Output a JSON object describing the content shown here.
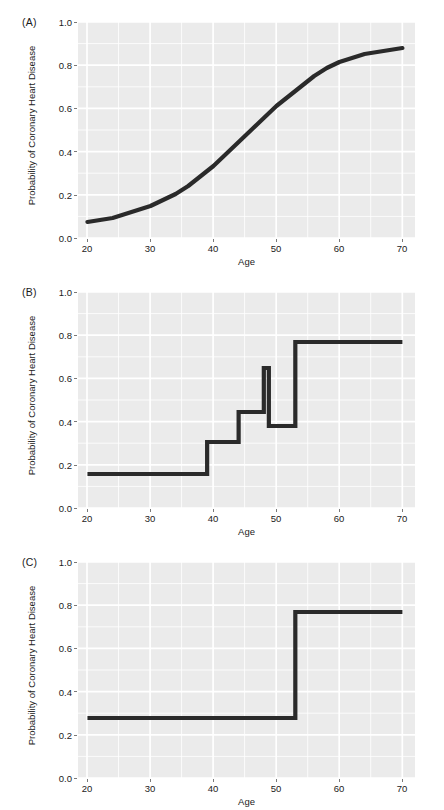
{
  "figure": {
    "width": 444,
    "height": 810,
    "panel_background": "#ebebeb",
    "gridline_color": "#ffffff",
    "line_color": "#2a2a2a",
    "axis_text_color": "#1a1a1a"
  },
  "axes": {
    "xlabel": "Age",
    "ylabel": "Probability of Coronary Heart Disease",
    "xlim": [
      18.5,
      72
    ],
    "ylim": [
      -0.03,
      1.05
    ],
    "xticks": [
      20,
      30,
      40,
      50,
      60,
      70
    ],
    "xtick_labels": [
      "20",
      "30",
      "40",
      "50",
      "60",
      "70"
    ],
    "yticks": [
      0.0,
      0.2,
      0.4,
      0.6,
      0.8,
      1.0
    ],
    "ytick_labels": [
      "0.0",
      "0.2",
      "0.4",
      "0.6",
      "0.8",
      "1.0"
    ],
    "x_minor_ticks": [
      25,
      35,
      45,
      55,
      65
    ],
    "y_minor_ticks": [
      0.1,
      0.3,
      0.5,
      0.7,
      0.9
    ],
    "grid": true
  },
  "panels": [
    {
      "id": "A",
      "tag": "(A)"
    },
    {
      "id": "B",
      "tag": "(B)"
    },
    {
      "id": "C",
      "tag": "(C)"
    }
  ],
  "chart_data": [
    {
      "type": "line",
      "panel": "(A)",
      "title": "",
      "xlabel": "Age",
      "ylabel": "Probability of Coronary Heart Disease",
      "xlim": [
        18.5,
        72
      ],
      "ylim": [
        -0.03,
        1.05
      ],
      "grid": true,
      "legend": "none",
      "series": [
        {
          "name": "logistic fit",
          "shape": "sigmoid",
          "x": [
            20,
            22,
            24,
            26,
            28,
            30,
            32,
            34,
            36,
            38,
            40,
            42,
            44,
            46,
            48,
            50,
            52,
            54,
            56,
            58,
            60,
            62,
            64,
            66,
            68,
            70
          ],
          "y": [
            0.05,
            0.06,
            0.07,
            0.09,
            0.11,
            0.13,
            0.16,
            0.19,
            0.23,
            0.28,
            0.33,
            0.39,
            0.45,
            0.51,
            0.57,
            0.63,
            0.68,
            0.73,
            0.78,
            0.82,
            0.85,
            0.87,
            0.89,
            0.9,
            0.91,
            0.92
          ]
        }
      ]
    },
    {
      "type": "line",
      "panel": "(B)",
      "title": "",
      "xlabel": "Age",
      "ylabel": "Probability of Coronary Heart Disease",
      "xlim": [
        18.5,
        72
      ],
      "ylim": [
        -0.03,
        1.05
      ],
      "grid": true,
      "legend": "none",
      "series": [
        {
          "name": "step function (many splits)",
          "shape": "step",
          "breakpoints": [
            39,
            44,
            48,
            48.8,
            50,
            53
          ],
          "levels": [
            0.14,
            0.3,
            0.45,
            0.67,
            0.38,
            0.8
          ],
          "x": [
            20,
            39,
            39,
            44,
            44,
            48,
            48,
            48.8,
            48.8,
            50,
            50,
            53,
            53,
            70
          ],
          "y": [
            0.14,
            0.14,
            0.3,
            0.3,
            0.45,
            0.45,
            0.67,
            0.67,
            0.38,
            0.38,
            0.38,
            0.38,
            0.8,
            0.8
          ]
        }
      ]
    },
    {
      "type": "line",
      "panel": "(C)",
      "title": "",
      "xlabel": "Age",
      "ylabel": "Probability of Coronary Heart Disease",
      "xlim": [
        18.5,
        72
      ],
      "ylim": [
        -0.03,
        1.05
      ],
      "grid": true,
      "legend": "none",
      "series": [
        {
          "name": "step function (single split)",
          "shape": "step",
          "breakpoints": [
            53
          ],
          "levels": [
            0.27,
            0.8
          ],
          "x": [
            20,
            53,
            53,
            70
          ],
          "y": [
            0.27,
            0.27,
            0.8,
            0.8
          ]
        }
      ]
    }
  ]
}
